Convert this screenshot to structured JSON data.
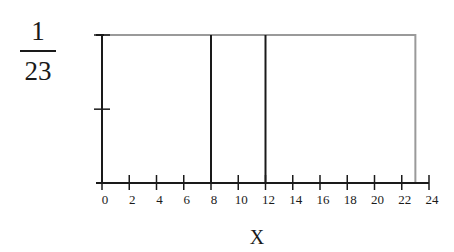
{
  "chart_data": {
    "type": "line",
    "title": "",
    "xlabel": "X",
    "ylabel": "",
    "y_top_label": {
      "numerator": "1",
      "denominator": "23"
    },
    "xlim": [
      0,
      24
    ],
    "ylim": [
      0,
      0.0435
    ],
    "x_ticks": [
      0,
      2,
      4,
      6,
      8,
      10,
      12,
      14,
      16,
      18,
      20,
      22,
      24
    ],
    "x_tick_labels": [
      "0",
      "2",
      "4",
      "6",
      "8",
      "10",
      "12",
      "14",
      "16",
      "18",
      "20",
      "22",
      "24"
    ],
    "y_ticks": [
      0.0217,
      0.0435
    ],
    "series": [
      {
        "name": "density",
        "x": [
          0,
          0,
          23,
          23
        ],
        "y": [
          0,
          0.0435,
          0.0435,
          0
        ]
      }
    ],
    "vertical_lines": [
      8,
      12
    ],
    "grid": false,
    "legend": null
  },
  "colors": {
    "axis": "#1a1a1a",
    "density_outline": "#9a9a9a",
    "reference_lines": "#1a1a1a"
  }
}
